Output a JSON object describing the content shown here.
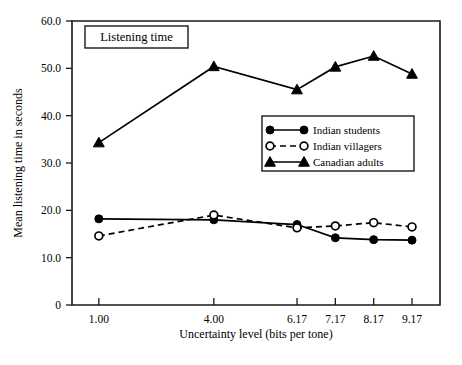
{
  "chart_data": {
    "type": "line",
    "title": "Listening time",
    "xlabel": "Uncertainty level (bits per tone)",
    "ylabel": "Mean listening time in seconds",
    "x": [
      1.0,
      4.0,
      6.17,
      7.17,
      8.17,
      9.17
    ],
    "xtick_labels": [
      "1.00",
      "4.00",
      "6.17",
      "7.17",
      "8.17",
      "9.17"
    ],
    "ytick_labels": [
      "0",
      "10.0",
      "20.0",
      "30.0",
      "40.0",
      "50.0",
      "60.0"
    ],
    "ytick_values": [
      0,
      10,
      20,
      30,
      40,
      50,
      60
    ],
    "xlim": [
      0.3,
      9.9
    ],
    "ylim": [
      0,
      60
    ],
    "grid": false,
    "legend_position": "center-right",
    "series": [
      {
        "name": "Indian students",
        "marker": "filled-circle",
        "linestyle": "solid",
        "color": "#000000",
        "values": [
          18.2,
          18.0,
          17.0,
          14.2,
          13.8,
          13.7
        ]
      },
      {
        "name": "Indian villagers",
        "marker": "open-circle",
        "linestyle": "dashed",
        "color": "#000000",
        "values": [
          14.6,
          19.0,
          16.3,
          16.7,
          17.4,
          16.5
        ]
      },
      {
        "name": "Canadian adults",
        "marker": "filled-triangle",
        "linestyle": "solid",
        "color": "#000000",
        "values": [
          34.3,
          50.4,
          45.5,
          50.3,
          52.6,
          48.8
        ]
      }
    ]
  }
}
